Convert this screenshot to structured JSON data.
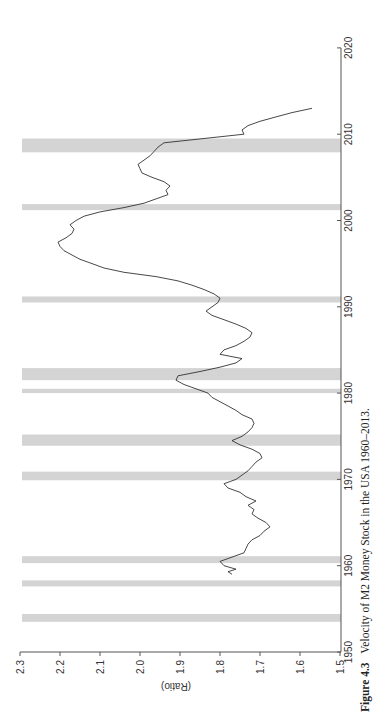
{
  "caption": {
    "label": "Figure 4.3",
    "text": "Velocity of M2 Money Stock in the USA 1960–2013."
  },
  "colors": {
    "line": "#333333",
    "recession_band": "#d4d4d4",
    "axis": "#555555"
  },
  "chart_data": {
    "type": "line",
    "orientation": "rotated 90° counter-clockwise (years run bottom-to-top along right side; ratio axis along bottom, high values on left)",
    "title": "Velocity of M2 Money Stock in the USA 1960–2013",
    "xlabel": "",
    "ylabel": "(Ratio)",
    "xlim": [
      1950,
      2020
    ],
    "ylim": [
      1.5,
      2.3
    ],
    "x_ticks": [
      1950,
      1960,
      1970,
      1980,
      1990,
      2000,
      2010,
      2020
    ],
    "y_ticks": [
      "1.5",
      "1.6",
      "1.7",
      "1.8",
      "1.9",
      "2.0",
      "2.1",
      "2.2",
      "2.3"
    ],
    "grid": false,
    "legend": null,
    "recession_bands": [
      [
        1953.5,
        1954.4
      ],
      [
        1957.6,
        1958.3
      ],
      [
        1960.3,
        1961.1
      ],
      [
        1969.9,
        1970.9
      ],
      [
        1973.9,
        1975.2
      ],
      [
        1980.0,
        1980.5
      ],
      [
        1981.5,
        1982.9
      ],
      [
        1990.5,
        1991.2
      ],
      [
        2001.2,
        2001.9
      ],
      [
        2007.9,
        2009.5
      ]
    ],
    "series": [
      {
        "name": "M2 Velocity",
        "x": [
          1959.0,
          1959.3,
          1959.6,
          1960.0,
          1960.5,
          1961.0,
          1961.5,
          1962.0,
          1962.5,
          1963.0,
          1963.5,
          1964.0,
          1964.5,
          1965.0,
          1965.5,
          1966.0,
          1966.5,
          1967.0,
          1967.5,
          1968.0,
          1968.5,
          1969.0,
          1969.5,
          1970.0,
          1970.5,
          1971.0,
          1971.5,
          1972.0,
          1972.5,
          1973.0,
          1973.5,
          1974.0,
          1974.5,
          1975.0,
          1975.5,
          1976.0,
          1976.5,
          1977.0,
          1977.5,
          1978.0,
          1978.5,
          1979.0,
          1979.5,
          1980.0,
          1980.5,
          1981.0,
          1981.5,
          1982.0,
          1982.5,
          1983.0,
          1983.5,
          1984.0,
          1984.5,
          1985.0,
          1985.5,
          1986.0,
          1986.5,
          1987.0,
          1987.5,
          1988.0,
          1988.5,
          1989.0,
          1989.5,
          1990.0,
          1990.5,
          1991.0,
          1991.5,
          1992.0,
          1992.5,
          1993.0,
          1993.5,
          1994.0,
          1994.5,
          1995.0,
          1995.5,
          1996.0,
          1996.5,
          1997.0,
          1997.5,
          1998.0,
          1998.5,
          1999.0,
          1999.5,
          2000.0,
          2000.5,
          2001.0,
          2001.5,
          2002.0,
          2002.5,
          2003.0,
          2003.5,
          2004.0,
          2004.5,
          2005.0,
          2005.5,
          2006.0,
          2006.5,
          2007.0,
          2007.5,
          2008.0,
          2008.5,
          2009.0,
          2009.5,
          2010.0,
          2010.5,
          2011.0,
          2011.5,
          2012.0,
          2012.5,
          2013.0
        ],
        "y": [
          1.77,
          1.78,
          1.76,
          1.79,
          1.8,
          1.77,
          1.74,
          1.735,
          1.73,
          1.72,
          1.7,
          1.69,
          1.675,
          1.685,
          1.705,
          1.72,
          1.715,
          1.73,
          1.71,
          1.735,
          1.75,
          1.78,
          1.79,
          1.76,
          1.745,
          1.73,
          1.72,
          1.71,
          1.695,
          1.7,
          1.72,
          1.75,
          1.77,
          1.745,
          1.73,
          1.72,
          1.715,
          1.72,
          1.745,
          1.76,
          1.78,
          1.8,
          1.82,
          1.83,
          1.86,
          1.89,
          1.91,
          1.905,
          1.85,
          1.8,
          1.76,
          1.745,
          1.8,
          1.79,
          1.76,
          1.74,
          1.725,
          1.72,
          1.735,
          1.76,
          1.79,
          1.82,
          1.835,
          1.82,
          1.805,
          1.8,
          1.815,
          1.84,
          1.87,
          1.905,
          1.96,
          2.04,
          2.09,
          2.12,
          2.15,
          2.17,
          2.19,
          2.2,
          2.205,
          2.185,
          2.17,
          2.165,
          2.175,
          2.16,
          2.14,
          2.1,
          2.04,
          1.99,
          1.96,
          1.93,
          1.935,
          1.925,
          1.94,
          1.97,
          1.995,
          2.0,
          2.005,
          1.99,
          1.975,
          1.965,
          1.955,
          1.94,
          1.84,
          1.74,
          1.745,
          1.73,
          1.7,
          1.66,
          1.62,
          1.57
        ]
      }
    ]
  }
}
